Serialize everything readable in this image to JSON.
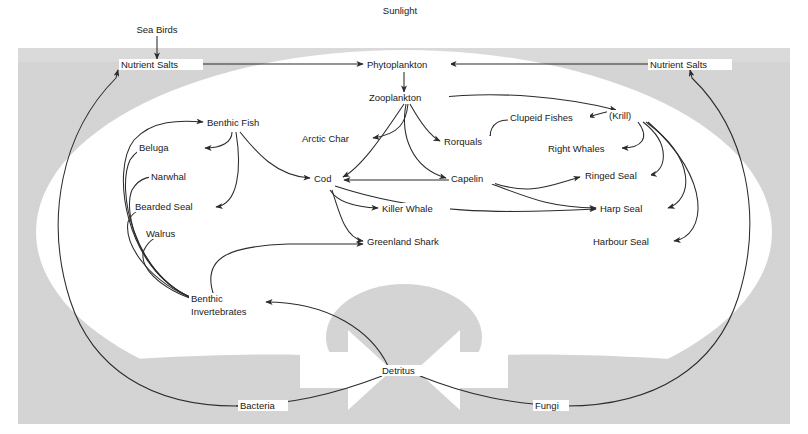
{
  "diagram": {
    "type": "food-web",
    "colors": {
      "background": "#ffffff",
      "panel_grey": "#d2d2d2",
      "panel_grey_light": "#dcdcdc",
      "inner_white": "#ffffff",
      "line": "#2b2b2b",
      "text": "#1a1a1a",
      "detritus_ellipse": "#d2d2d2",
      "arrow_white": "#ffffff"
    }
  },
  "labels": {
    "sunlight": "Sunlight",
    "sea_birds": "Sea Birds",
    "nutrient_salts_left": "Nutrient Salts",
    "nutrient_salts_right": "Nutrient Salts",
    "phytoplankton": "Phytoplankton",
    "zooplankton": "Zooplankton",
    "benthic_fish": "Benthic Fish",
    "beluga": "Beluga",
    "narwhal": "Narwhal",
    "bearded_seal": "Bearded Seal",
    "walrus": "Walrus",
    "arctic_char": "Arctic Char",
    "cod": "Cod",
    "killer_whale": "Killer Whale",
    "greenland_shark": "Greenland Shark",
    "benthic_invertebrates_l1": "Benthic",
    "benthic_invertebrates_l2": "Invertebrates",
    "rorquals": "Rorquals",
    "capelin": "Capelin",
    "clupeid_fishes": "Clupeid Fishes",
    "krill": "(Krill)",
    "right_whales": "Right Whales",
    "ringed_seal": "Ringed Seal",
    "harp_seal": "Harp Seal",
    "harbour_seal": "Harbour Seal",
    "detritus": "Detritus",
    "bacteria": "Bacteria",
    "fungi": "Fungi"
  },
  "nodes": [
    {
      "id": "sunlight",
      "label": "Sunlight",
      "x": 400,
      "y": 10,
      "anchor": "middle"
    },
    {
      "id": "sea-birds",
      "label": "Sea Birds",
      "x": 157,
      "y": 30,
      "anchor": "middle"
    },
    {
      "id": "nutrient-salts-left",
      "label": "Nutrient Salts",
      "x": 124,
      "y": 67,
      "anchor": "start"
    },
    {
      "id": "phytoplankton",
      "label": "Phytoplankton",
      "x": 370,
      "y": 67,
      "anchor": "start"
    },
    {
      "id": "nutrient-salts-right",
      "label": "Nutrient Salts",
      "x": 653,
      "y": 67,
      "anchor": "start"
    },
    {
      "id": "zooplankton",
      "label": "Zooplankton",
      "x": 372,
      "y": 100,
      "anchor": "start"
    },
    {
      "id": "benthic-fish",
      "label": "Benthic Fish",
      "x": 208,
      "y": 125,
      "anchor": "start"
    },
    {
      "id": "clupeid-fishes",
      "label": "Clupeid Fishes",
      "x": 511,
      "y": 120,
      "anchor": "start"
    },
    {
      "id": "krill",
      "label": "(Krill)",
      "x": 610,
      "y": 118,
      "anchor": "start"
    },
    {
      "id": "arctic-char",
      "label": "Arctic Char",
      "x": 303,
      "y": 141,
      "anchor": "start"
    },
    {
      "id": "rorquals",
      "label": "Rorquals",
      "x": 445,
      "y": 144,
      "anchor": "start"
    },
    {
      "id": "right-whales",
      "label": "Right Whales",
      "x": 549,
      "y": 151,
      "anchor": "start"
    },
    {
      "id": "beluga",
      "label": "Beluga",
      "x": 140,
      "y": 150,
      "anchor": "start"
    },
    {
      "id": "narwhal",
      "label": "Narwhal",
      "x": 152,
      "y": 179,
      "anchor": "start"
    },
    {
      "id": "cod",
      "label": "Cod",
      "x": 315,
      "y": 181,
      "anchor": "start"
    },
    {
      "id": "capelin",
      "label": "Capelin",
      "x": 452,
      "y": 181,
      "anchor": "start"
    },
    {
      "id": "ringed-seal",
      "label": "Ringed Seal",
      "x": 586,
      "y": 178,
      "anchor": "start"
    },
    {
      "id": "bearded-seal",
      "label": "Bearded Seal",
      "x": 136,
      "y": 209,
      "anchor": "start"
    },
    {
      "id": "killer-whale",
      "label": "Killer Whale",
      "x": 383,
      "y": 211,
      "anchor": "start"
    },
    {
      "id": "harp-seal",
      "label": "Harp Seal",
      "x": 601,
      "y": 211,
      "anchor": "start"
    },
    {
      "id": "walrus",
      "label": "Walrus",
      "x": 147,
      "y": 236,
      "anchor": "start"
    },
    {
      "id": "greenland-shark",
      "label": "Greenland Shark",
      "x": 368,
      "y": 244,
      "anchor": "start"
    },
    {
      "id": "harbour-seal",
      "label": "Harbour Seal",
      "x": 594,
      "y": 244,
      "anchor": "start"
    },
    {
      "id": "benthic-invertebrates",
      "label": "Benthic Invertebrates",
      "x": 192,
      "y": 302,
      "anchor": "start"
    },
    {
      "id": "detritus",
      "label": "Detritus",
      "x": 383,
      "y": 373,
      "anchor": "start"
    },
    {
      "id": "bacteria",
      "label": "Bacteria",
      "x": 241,
      "y": 408,
      "anchor": "start"
    },
    {
      "id": "fungi",
      "label": "Fungi",
      "x": 536,
      "y": 408,
      "anchor": "start"
    }
  ],
  "flows": [
    {
      "from": "sea-birds",
      "to": "nutrient-salts-left"
    },
    {
      "from": "nutrient-salts-left",
      "to": "phytoplankton"
    },
    {
      "from": "nutrient-salts-right",
      "to": "phytoplankton"
    },
    {
      "from": "phytoplankton",
      "to": "zooplankton"
    },
    {
      "from": "zooplankton",
      "to": "arctic-char"
    },
    {
      "from": "zooplankton",
      "to": "rorquals"
    },
    {
      "from": "zooplankton",
      "to": "capelin"
    },
    {
      "from": "zooplankton",
      "to": "cod"
    },
    {
      "from": "zooplankton",
      "to": "krill"
    },
    {
      "from": "krill",
      "to": "clupeid-fishes"
    },
    {
      "from": "krill",
      "to": "right-whales"
    },
    {
      "from": "krill",
      "to": "ringed-seal"
    },
    {
      "from": "krill",
      "to": "harp-seal"
    },
    {
      "from": "krill",
      "to": "harbour-seal"
    },
    {
      "from": "clupeid-fishes",
      "to": "rorquals"
    },
    {
      "from": "capelin",
      "to": "cod"
    },
    {
      "from": "capelin",
      "to": "harp-seal"
    },
    {
      "from": "capelin",
      "to": "ringed-seal"
    },
    {
      "from": "cod",
      "to": "killer-whale"
    },
    {
      "from": "cod",
      "to": "greenland-shark"
    },
    {
      "from": "cod",
      "to": "harp-seal"
    },
    {
      "from": "benthic-fish",
      "to": "beluga"
    },
    {
      "from": "benthic-fish",
      "to": "bearded-seal"
    },
    {
      "from": "benthic-fish",
      "to": "cod"
    },
    {
      "from": "benthic-invertebrates",
      "to": "benthic-fish"
    },
    {
      "from": "benthic-invertebrates",
      "to": "beluga"
    },
    {
      "from": "benthic-invertebrates",
      "to": "narwhal"
    },
    {
      "from": "benthic-invertebrates",
      "to": "bearded-seal"
    },
    {
      "from": "benthic-invertebrates",
      "to": "walrus"
    },
    {
      "from": "benthic-invertebrates",
      "to": "greenland-shark"
    },
    {
      "from": "detritus",
      "to": "benthic-invertebrates"
    },
    {
      "from": "detritus",
      "to": "nutrient-salts-left",
      "via": "bacteria"
    },
    {
      "from": "detritus",
      "to": "nutrient-salts-right",
      "via": "fungi"
    }
  ]
}
